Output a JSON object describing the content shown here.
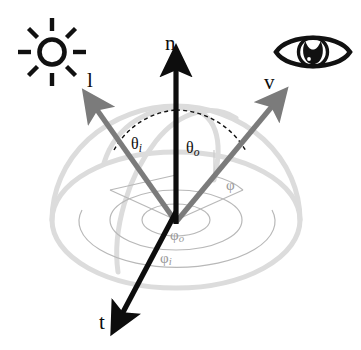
{
  "figure": {
    "background_color": "#ffffff"
  },
  "icons": [
    {
      "name": "sun-icon",
      "meaning": "incident light source",
      "color": "#111111",
      "center": [
        52,
        52
      ],
      "radius": 13,
      "ray_count": 8
    },
    {
      "name": "eye-icon",
      "meaning": "viewer / camera",
      "color": "#111111",
      "center": [
        313,
        52
      ]
    }
  ],
  "vectors": [
    {
      "name": "normal",
      "label": "n",
      "color": "#0d0d0d",
      "label_pos": [
        165,
        33
      ],
      "from": [
        176,
        222
      ],
      "to": [
        176,
        62
      ]
    },
    {
      "name": "light",
      "label": "l",
      "color": "#7b7b7b",
      "label_pos": [
        87,
        70
      ],
      "from": [
        176,
        222
      ],
      "to": [
        92,
        104
      ]
    },
    {
      "name": "view",
      "label": "v",
      "color": "#7b7b7b",
      "label_pos": [
        264,
        72
      ],
      "from": [
        176,
        222
      ],
      "to": [
        277,
        101
      ]
    },
    {
      "name": "tangent",
      "label": "t",
      "color": "#0d0d0d",
      "label_pos": [
        99,
        312
      ],
      "from": [
        176,
        222
      ],
      "to": [
        124,
        320
      ]
    }
  ],
  "angles": [
    {
      "name": "theta-incident",
      "symbol": "θ",
      "subscript": "i",
      "label_pos": [
        131,
        136
      ],
      "color": "#111111",
      "arc_style": "dashed"
    },
    {
      "name": "theta-outgoing",
      "symbol": "θ",
      "subscript": "o",
      "label_pos": [
        186,
        140
      ],
      "color": "#111111",
      "arc_style": "dashed"
    },
    {
      "name": "phi-relative",
      "symbol": "φ",
      "subscript": "",
      "label_pos": [
        226,
        178
      ],
      "color": "#9a9a9a",
      "arc_style": "solid"
    },
    {
      "name": "phi-outgoing",
      "symbol": "φ",
      "subscript": "o",
      "label_pos": [
        170,
        228
      ],
      "color": "#9a9a9a",
      "arc_style": "solid"
    },
    {
      "name": "phi-incident",
      "symbol": "φ",
      "subscript": "i",
      "label_pos": [
        160,
        251
      ],
      "color": "#9a9a9a",
      "arc_style": "solid"
    }
  ],
  "hemisphere": {
    "name": "unit-hemisphere",
    "color": "#dcdcdc",
    "center": [
      176,
      220
    ],
    "base_rx": 124,
    "base_ry": 68,
    "dome_height": 114,
    "stroke_width": 5
  },
  "azimuth_arcs": {
    "color": "#b8b8b8",
    "stroke_width": 1.2,
    "radii": [
      34,
      62,
      92
    ]
  },
  "colors": {
    "ink": "#111111",
    "vector_gray": "#7b7b7b",
    "hemisphere_gray": "#dcdcdc",
    "arc_gray": "#b8b8b8",
    "phi_label_gray": "#9a9a9a",
    "background": "#ffffff"
  }
}
